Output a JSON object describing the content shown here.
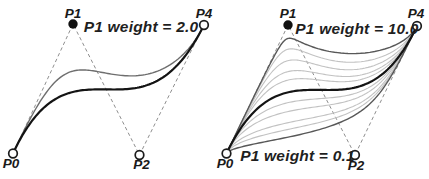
{
  "figure": {
    "width": 429,
    "height": 179,
    "background": "#ffffff"
  },
  "chart_data": {
    "type": "line",
    "grid": false,
    "legend": "none",
    "panels": [
      {
        "name": "left",
        "control_points": {
          "P0": [
            13,
            153.5
          ],
          "P1": [
            73,
            24
          ],
          "P2": [
            139.5,
            155
          ],
          "P4": [
            204,
            25
          ]
        },
        "control_polygon": [
          "P0",
          "P1",
          "P2",
          "P4"
        ],
        "curves": [
          {
            "p1_weight": 2.0,
            "color": "#6e6e6e",
            "width": 1.4,
            "role": "weighted-curve"
          },
          {
            "p1_weight": 1.0,
            "color": "#141414",
            "width": 2.2,
            "role": "main-curve"
          }
        ],
        "points": [
          {
            "id": "P0",
            "label": "P0",
            "style": "open",
            "label_pos": [
              11,
              168
            ]
          },
          {
            "id": "P1",
            "label": "P1",
            "style": "filled",
            "label_pos": [
              73,
              17.5
            ]
          },
          {
            "id": "P2",
            "label": "P2",
            "style": "open",
            "label_pos": [
              141.5,
              169
            ]
          },
          {
            "id": "P4",
            "label": "P4",
            "style": "open",
            "label_pos": [
              204,
              17.5
            ]
          }
        ],
        "annotations": [
          {
            "id": "weight-label",
            "text": "P1 weight = 2.0",
            "pos": [
              141,
              32
            ],
            "anchor": "middle"
          }
        ]
      },
      {
        "name": "right",
        "control_points": {
          "P0": [
            226.5,
            153.5
          ],
          "P1": [
            288,
            25
          ],
          "P2": [
            355,
            155
          ],
          "P4": [
            417,
            26
          ]
        },
        "control_polygon": [
          "P0",
          "P1",
          "P2",
          "P4"
        ],
        "curves": [
          {
            "p1_weight": 0.2,
            "color": "#c2c2c2",
            "width": 1.1,
            "role": "family-curve"
          },
          {
            "p1_weight": 0.3,
            "color": "#c2c2c2",
            "width": 1.1,
            "role": "family-curve"
          },
          {
            "p1_weight": 0.5,
            "color": "#c2c2c2",
            "width": 1.1,
            "role": "family-curve"
          },
          {
            "p1_weight": 0.7,
            "color": "#c2c2c2",
            "width": 1.1,
            "role": "family-curve"
          },
          {
            "p1_weight": 1.5,
            "color": "#c2c2c2",
            "width": 1.1,
            "role": "family-curve"
          },
          {
            "p1_weight": 2.0,
            "color": "#c2c2c2",
            "width": 1.1,
            "role": "family-curve"
          },
          {
            "p1_weight": 3.0,
            "color": "#c2c2c2",
            "width": 1.1,
            "role": "family-curve"
          },
          {
            "p1_weight": 5.0,
            "color": "#c2c2c2",
            "width": 1.1,
            "role": "family-curve"
          },
          {
            "p1_weight": 10.0,
            "color": "#585858",
            "width": 1.4,
            "role": "max-weight-curve"
          },
          {
            "p1_weight": 0.1,
            "color": "#585858",
            "width": 1.4,
            "role": "min-weight-curve"
          },
          {
            "p1_weight": 1.0,
            "color": "#141414",
            "width": 2.2,
            "role": "main-curve"
          }
        ],
        "points": [
          {
            "id": "P0",
            "label": "P0",
            "style": "open",
            "label_pos": [
              225,
              167.5
            ]
          },
          {
            "id": "P1",
            "label": "P1",
            "style": "filled",
            "label_pos": [
              288,
              17.5
            ]
          },
          {
            "id": "P2",
            "label": "P2",
            "style": "open",
            "label_pos": [
              356,
              170
            ]
          },
          {
            "id": "P4",
            "label": "P4",
            "style": "open",
            "label_pos": [
              416,
              17.5
            ]
          }
        ],
        "annotations": [
          {
            "id": "weight-label-top",
            "text": "P1 weight = 10.0",
            "pos": [
              357,
              34
            ],
            "anchor": "middle"
          },
          {
            "id": "weight-label-bottom",
            "text": "P1 weight = 0.1",
            "pos": [
              297.5,
              160.5
            ],
            "anchor": "middle"
          }
        ]
      }
    ]
  },
  "styles": {
    "dashed_line": {
      "color": "#8f8f8f",
      "width": 1,
      "dash": "3.5,2.8"
    },
    "open_point": {
      "radius": 4.3,
      "stroke": "#1c1c1c",
      "stroke_width": 1.7,
      "fill": "#ffffff"
    },
    "filled_point": {
      "radius": 4.7,
      "fill": "#111111"
    },
    "label_color": "#1a1a1a"
  }
}
